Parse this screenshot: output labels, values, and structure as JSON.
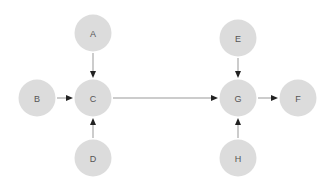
{
  "canvas": {
    "width": 334,
    "height": 188,
    "background": "#ffffff"
  },
  "style": {
    "node_fill": "#dcdcdc",
    "node_radius": 18.5,
    "label_color": "#555555",
    "label_font_size": 9,
    "edge_color": "#999999",
    "arrowhead_color": "#222222",
    "edge_width": 1
  },
  "diagram": {
    "type": "directed-graph",
    "title": "",
    "nodes": [
      {
        "id": "A",
        "label": "A",
        "cx": 93,
        "cy": 33
      },
      {
        "id": "B",
        "label": "B",
        "cx": 37,
        "cy": 98
      },
      {
        "id": "C",
        "label": "C",
        "cx": 93,
        "cy": 98
      },
      {
        "id": "D",
        "label": "D",
        "cx": 93,
        "cy": 158
      },
      {
        "id": "E",
        "label": "E",
        "cx": 238,
        "cy": 38
      },
      {
        "id": "F",
        "label": "F",
        "cx": 298,
        "cy": 98
      },
      {
        "id": "G",
        "label": "G",
        "cx": 238,
        "cy": 98
      },
      {
        "id": "H",
        "label": "H",
        "cx": 238,
        "cy": 158
      }
    ],
    "edges": [
      {
        "id": "A-C",
        "from": "A",
        "to": "C",
        "direction": "down"
      },
      {
        "id": "B-C",
        "from": "B",
        "to": "C",
        "direction": "right"
      },
      {
        "id": "D-C",
        "from": "D",
        "to": "C",
        "direction": "up"
      },
      {
        "id": "C-G",
        "from": "C",
        "to": "G",
        "direction": "right"
      },
      {
        "id": "E-G",
        "from": "E",
        "to": "G",
        "direction": "down"
      },
      {
        "id": "H-G",
        "from": "H",
        "to": "G",
        "direction": "up"
      },
      {
        "id": "G-F",
        "from": "G",
        "to": "F",
        "direction": "right"
      }
    ]
  }
}
